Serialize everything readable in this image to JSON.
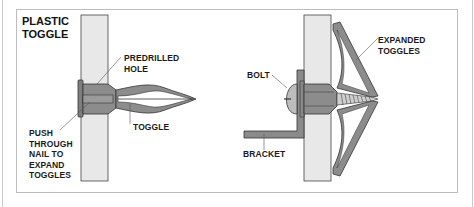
{
  "title": "PLASTIC\nTOGGLE",
  "left_diagram": {
    "labels": {
      "predrilled_hole": "PREDRILLED\nHOLE",
      "toggle": "TOGGLE",
      "push_through": "PUSH\nTHROUGH\nNAIL TO\nEXPAND\nTOGGLES"
    }
  },
  "right_diagram": {
    "labels": {
      "expanded_toggles": "EXPANDED\nTOGGLES",
      "bolt": "BOLT",
      "bracket": "BRACKET"
    }
  },
  "colors": {
    "wall": "#e6e6e6",
    "anchor": "#8a8a8a",
    "outline": "#333333",
    "leader": "#555555"
  }
}
